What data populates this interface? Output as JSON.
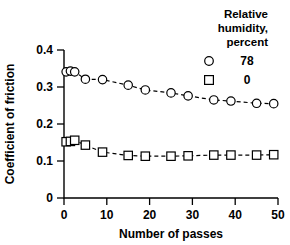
{
  "chart_data": {
    "type": "scatter",
    "title": "",
    "xlabel": "Number of passes",
    "ylabel": "Coefficient of friction",
    "xlim": [
      0,
      50
    ],
    "ylim": [
      0,
      0.4
    ],
    "xticks": [
      "0",
      "10",
      "20",
      "30",
      "40",
      "50"
    ],
    "yticks": [
      "0",
      "0.1",
      "0.2",
      "0.3",
      "0.4"
    ],
    "grid": false,
    "legend_position": "top-right",
    "legend_title_lines": [
      "Relative",
      "humidity,",
      "percent"
    ],
    "series": [
      {
        "name": "78",
        "marker": "circle",
        "x": [
          0.5,
          1.5,
          2.5,
          5,
          9,
          15,
          19,
          25,
          29,
          35,
          39,
          45,
          49
        ],
        "values": [
          0.341,
          0.343,
          0.341,
          0.321,
          0.32,
          0.305,
          0.292,
          0.284,
          0.276,
          0.265,
          0.262,
          0.256,
          0.255
        ]
      },
      {
        "name": "0",
        "marker": "square",
        "x": [
          0.5,
          1.5,
          2.5,
          5,
          9,
          15,
          19,
          25,
          29,
          35,
          39,
          45,
          49
        ],
        "values": [
          0.152,
          0.153,
          0.156,
          0.143,
          0.124,
          0.115,
          0.113,
          0.113,
          0.114,
          0.116,
          0.116,
          0.116,
          0.117
        ]
      }
    ]
  },
  "legend": {
    "title_line_1": "Relative",
    "title_line_2": "humidity,",
    "title_line_3": "percent",
    "entries": [
      {
        "marker": "circle",
        "label": "78"
      },
      {
        "marker": "square",
        "label": "0"
      }
    ]
  },
  "axes": {
    "x_title": "Number of passes",
    "y_title": "Coefficient of friction",
    "x_tick_labels": [
      "0",
      "10",
      "20",
      "30",
      "40",
      "50"
    ],
    "y_tick_labels": [
      "0",
      "0.1",
      "0.2",
      "0.3",
      "0.4"
    ]
  },
  "colors": {
    "foreground": "#000000",
    "background": "#ffffff"
  }
}
